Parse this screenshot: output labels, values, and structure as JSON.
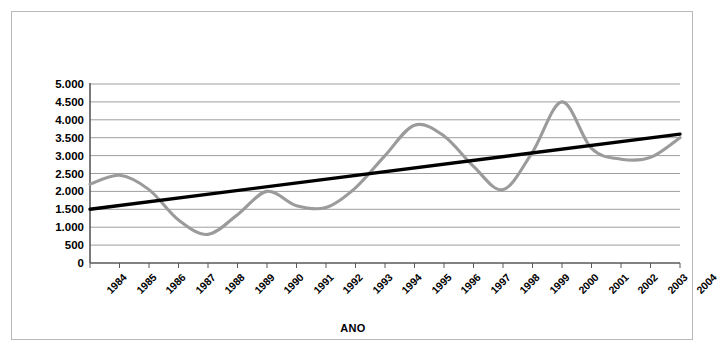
{
  "chart_data": {
    "type": "line",
    "title": "",
    "xlabel": "ANO",
    "ylabel": "CASOS",
    "ylim": [
      0,
      5000
    ],
    "ytick_labels": [
      "5.000",
      "4.500",
      "4.000",
      "3.500",
      "3.000",
      "2.500",
      "2.000",
      "1.500",
      "1.000",
      "500",
      "0"
    ],
    "ytick_values": [
      5000,
      4500,
      4000,
      3500,
      3000,
      2500,
      2000,
      1500,
      1000,
      500,
      0
    ],
    "grid": true,
    "legend": "none",
    "categories": [
      "1984",
      "1985",
      "1986",
      "1987",
      "1988",
      "1989",
      "1990",
      "1991",
      "1992",
      "1993",
      "1994",
      "1995",
      "1996",
      "1997",
      "1998",
      "1999",
      "2000",
      "2001",
      "2002",
      "2003",
      "2004"
    ],
    "x": [
      1984,
      1985,
      1986,
      1987,
      1988,
      1989,
      1990,
      1991,
      1992,
      1993,
      1994,
      1995,
      1996,
      1997,
      1998,
      1999,
      2000,
      2001,
      2002,
      2003,
      2004
    ],
    "series": [
      {
        "name": "CASOS",
        "type": "line-smooth",
        "color": "#9b9b9b",
        "values": [
          2200,
          2450,
          2050,
          1200,
          800,
          1350,
          2000,
          1600,
          1550,
          2100,
          3000,
          3850,
          3550,
          2700,
          2050,
          3100,
          4500,
          3200,
          2900,
          2950,
          3500
        ]
      },
      {
        "name": "Tendencia",
        "type": "trendline",
        "color": "#000000",
        "values": [
          1500,
          1605,
          1710,
          1815,
          1920,
          2025,
          2130,
          2235,
          2340,
          2445,
          2550,
          2655,
          2760,
          2865,
          2970,
          3075,
          3180,
          3285,
          3390,
          3495,
          3600
        ]
      }
    ]
  }
}
